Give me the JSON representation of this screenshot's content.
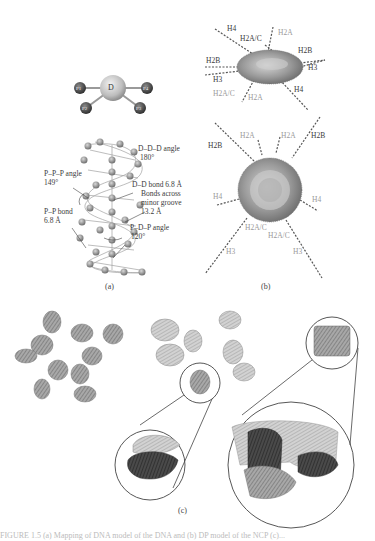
{
  "figure": {
    "panel_a": {
      "label": "(a)",
      "mapping": {
        "center": "D",
        "beads": [
          "P1",
          "P2",
          "P3",
          "P4"
        ]
      },
      "annotations": {
        "ddd_angle": "D–D–D angle",
        "ddd_angle_value": "180°",
        "ppp_angle": "P–P–P angle",
        "ppp_angle_value": "149°",
        "dd_bond": "D–D bond 6.8 Å",
        "bonds_across_1": "Bonds across",
        "bonds_across_2": "minor groove",
        "bonds_across_3": "13.2 Å",
        "pp_bond": "P–P bond",
        "pp_bond_value": "6.8 Å",
        "pdp_angle": "P–D–P angle",
        "pdp_angle_value": "120°"
      }
    },
    "panel_b": {
      "label": "(b)",
      "top_view_tails": {
        "h4_top": "H4",
        "h2ac_top": "H2A/C",
        "h2a_top": "H2A",
        "h2b_right": "H2B",
        "h3_right": "H3",
        "h2b_left": "H2B",
        "h3_left": "H3",
        "h2ac_bottom": "H2A/C",
        "h2a_bottom": "H2A",
        "h4_bottom": "H4"
      },
      "side_view_tails": {
        "h2b_left": "H2B",
        "h2a_1": "H2A",
        "h2a_2": "H2A",
        "h2b_right": "H2B",
        "h4_left": "H4",
        "h4_right": "H4",
        "h2ac_1": "H2A/C",
        "h2ac_2": "H2A/C",
        "h3_left": "H3",
        "h3_right": "H3"
      }
    },
    "panel_c": {
      "label": "(c)"
    },
    "caption": "FIGURE 1.5 (a) Mapping of DNA model of the DNA and (b) DP model of the NCP (c)..."
  }
}
